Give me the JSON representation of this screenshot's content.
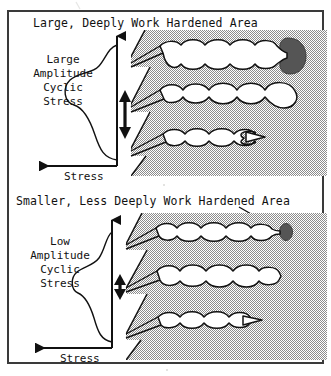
{
  "figure": {
    "kind": "technical-diagram",
    "border_color": "#3a3a3a",
    "background_color": "#ffffff",
    "ink_color": "#111111",
    "material_fill_color": "#b4b4b4",
    "work_hardened_zone_color": "#5a5a5a",
    "crack_fill_color": "#ffffff"
  },
  "panels": [
    {
      "id": "large-amplitude",
      "title": "Large, Deeply Work Hardened Area",
      "stress_label_lines": [
        "Large",
        "Amplitude",
        "Cyclic",
        "Stress"
      ],
      "axis_label": "Stress",
      "amplitude_arrow": "double-headed-vertical-arrow-large",
      "distribution": {
        "type": "bell-curve-horizontal",
        "peak_width": 58,
        "spread": "wide",
        "description": "Broad stress distribution indicating large amplitude cyclic stress"
      },
      "work_hardened_zone": {
        "size": "large",
        "shape": "kidney",
        "width": 26,
        "height": 34
      },
      "cracks": [
        {
          "id": "crack-1",
          "bubbles": 6,
          "length": 116,
          "tip": "blunt-at-hardened-zone"
        },
        {
          "id": "crack-2",
          "bubbles": 6,
          "length": 140,
          "tip": "rounded"
        },
        {
          "id": "crack-3",
          "bubbles": 5,
          "length": 104,
          "tip": "tapered"
        }
      ]
    },
    {
      "id": "low-amplitude",
      "title": "Smaller, Less Deeply Work Hardened Area",
      "stress_label_lines": [
        "Low",
        "Amplitude",
        "Cyclic",
        "Stress"
      ],
      "axis_label": "Stress",
      "amplitude_arrow": "double-headed-vertical-arrow-small",
      "distribution": {
        "type": "bell-curve-horizontal",
        "peak_width": 38,
        "spread": "narrow",
        "description": "Narrow stress distribution indicating low amplitude cyclic stress"
      },
      "work_hardened_zone": {
        "size": "small",
        "shape": "oval",
        "width": 12,
        "height": 16
      },
      "cracks": [
        {
          "id": "crack-1",
          "bubbles": 6,
          "length": 116,
          "tip": "blunt-at-hardened-zone"
        },
        {
          "id": "crack-2",
          "bubbles": 6,
          "length": 132,
          "tip": "tapered"
        },
        {
          "id": "crack-3",
          "bubbles": 5,
          "length": 104,
          "tip": "tapered"
        }
      ]
    }
  ]
}
